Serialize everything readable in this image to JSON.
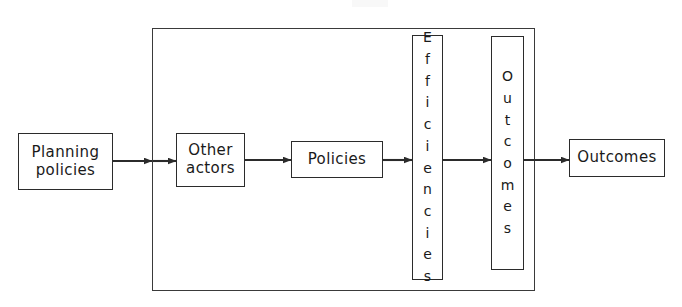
{
  "diagram": {
    "canvas": {
      "width": 682,
      "height": 307
    },
    "frame": {
      "name": "system-boundary",
      "x": 152,
      "y": 28,
      "width": 383,
      "height": 263,
      "stroke": "#3a3a3a"
    },
    "nodes": [
      {
        "id": "planning-policies",
        "label": "Planning\npolicies",
        "orientation": "horizontal",
        "x": 18,
        "y": 133,
        "width": 95,
        "height": 57
      },
      {
        "id": "other-actors",
        "label": "Other\nactors",
        "orientation": "horizontal",
        "x": 176,
        "y": 133,
        "width": 69,
        "height": 54
      },
      {
        "id": "policies",
        "label": "Policies",
        "orientation": "horizontal",
        "x": 291,
        "y": 141,
        "width": 92,
        "height": 37
      },
      {
        "id": "efficiencies",
        "label": "Efficiencies",
        "letters": [
          "E",
          "f",
          "f",
          "i",
          "c",
          "i",
          "e",
          "n",
          "c",
          "i",
          "e",
          "s"
        ],
        "orientation": "vertical",
        "x": 412,
        "y": 35,
        "width": 31,
        "height": 245
      },
      {
        "id": "outcomes-internal",
        "label": "Outcomes",
        "letters": [
          "O",
          "u",
          "t",
          "c",
          "o",
          "m",
          "e",
          "s"
        ],
        "orientation": "vertical",
        "x": 491,
        "y": 36,
        "width": 33,
        "height": 234
      },
      {
        "id": "outcomes-final",
        "label": "Outcomes",
        "orientation": "horizontal",
        "x": 569,
        "y": 139,
        "width": 96,
        "height": 38
      }
    ],
    "arrows": [
      {
        "id": "arrow-planning-to-frame",
        "from": "planning-policies",
        "to": "system-boundary",
        "x1": 113,
        "y1": 161,
        "x2": 152,
        "y2": 161
      },
      {
        "id": "arrow-frame-to-other-actors",
        "from": "system-boundary",
        "to": "other-actors",
        "x1": 153,
        "y1": 161,
        "x2": 176,
        "y2": 161
      },
      {
        "id": "arrow-other-actors-to-policies",
        "from": "other-actors",
        "to": "policies",
        "x1": 245,
        "y1": 160,
        "x2": 291,
        "y2": 160
      },
      {
        "id": "arrow-policies-to-efficiencies",
        "from": "policies",
        "to": "efficiencies",
        "x1": 383,
        "y1": 160,
        "x2": 412,
        "y2": 160
      },
      {
        "id": "arrow-efficiencies-to-outcomes-internal",
        "from": "efficiencies",
        "to": "outcomes-internal",
        "x1": 443,
        "y1": 160,
        "x2": 491,
        "y2": 160
      },
      {
        "id": "arrow-outcomes-internal-to-outcomes-final",
        "from": "outcomes-internal",
        "to": "outcomes-final",
        "x1": 524,
        "y1": 160,
        "x2": 569,
        "y2": 160
      }
    ],
    "colors": {
      "stroke": "#2b2b2b",
      "frame_stroke": "#3a3a3a",
      "text": "#1a1a1a",
      "background": "#ffffff"
    }
  }
}
